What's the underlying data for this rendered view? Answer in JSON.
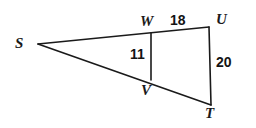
{
  "figure": {
    "type": "geometry-diagram",
    "background_color": "#ffffff",
    "stroke_color": "#1a1a1a",
    "stroke_width": 1.6,
    "vertices": [
      {
        "name": "S",
        "label": "S",
        "x": 38,
        "y": 44
      },
      {
        "name": "W",
        "label": "W",
        "x": 151,
        "y": 33
      },
      {
        "name": "U",
        "label": "U",
        "x": 209,
        "y": 27
      },
      {
        "name": "V",
        "label": "V",
        "x": 151,
        "y": 80
      },
      {
        "name": "T",
        "label": "T",
        "x": 211,
        "y": 105
      }
    ],
    "segments": [
      {
        "name": "segment-SU",
        "from": "S",
        "to": "U"
      },
      {
        "name": "segment-ST",
        "from": "S",
        "to": "T"
      },
      {
        "name": "segment-UT",
        "from": "U",
        "to": "T"
      },
      {
        "name": "segment-WV",
        "from": "W",
        "to": "V"
      }
    ],
    "measures": [
      {
        "name": "WU",
        "value": "18",
        "segment": "segment-WU"
      },
      {
        "name": "WV",
        "value": "11",
        "segment": "segment-WV"
      },
      {
        "name": "UT",
        "value": "20",
        "segment": "segment-UT"
      }
    ]
  }
}
